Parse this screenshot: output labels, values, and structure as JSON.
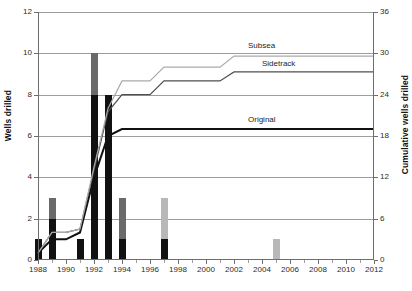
{
  "chart_data": {
    "type": "bar",
    "title": "",
    "xlabel": "",
    "ylabel": "Wells drilled",
    "y2label": "Cumulative wells drilled",
    "xlim": [
      1988,
      2012
    ],
    "ylim": [
      0,
      12
    ],
    "y2lim": [
      0,
      36
    ],
    "grid": true,
    "legend_position": "inline-right-of-lines",
    "x_ticks": [
      1988,
      1990,
      1992,
      1994,
      1996,
      1998,
      2000,
      2002,
      2004,
      2006,
      2008,
      2010,
      2012
    ],
    "y_ticks": [
      0,
      2,
      4,
      6,
      8,
      10,
      12
    ],
    "y2_ticks": [
      0,
      6,
      12,
      18,
      24,
      30,
      36
    ],
    "categories": [
      1988,
      1989,
      1990,
      1991,
      1992,
      1993,
      1994,
      1995,
      1996,
      1997,
      1998,
      1999,
      2000,
      2001,
      2002,
      2003,
      2004,
      2005,
      2006,
      2007,
      2008,
      2009,
      2010,
      2011,
      2012
    ],
    "series": [
      {
        "name": "Original",
        "kind": "bar-segment",
        "color": "#111111",
        "values": [
          1,
          2,
          0,
          1,
          8,
          8,
          1,
          0,
          0,
          1,
          0,
          0,
          0,
          0,
          0,
          0,
          0,
          0,
          0,
          0,
          0,
          0,
          0,
          0,
          0
        ]
      },
      {
        "name": "Sidetrack",
        "kind": "bar-segment",
        "color": "#6a6a6a",
        "values": [
          0,
          1,
          0,
          0,
          2,
          0,
          2,
          0,
          0,
          0,
          0,
          0,
          0,
          0,
          0,
          0,
          0,
          0,
          0,
          0,
          0,
          0,
          0,
          0,
          0
        ]
      },
      {
        "name": "Subsea",
        "kind": "bar-segment",
        "color": "#b8b8b8",
        "values": [
          0,
          0,
          0,
          0,
          0,
          0,
          0,
          0,
          0,
          2,
          0,
          0,
          0,
          0,
          0,
          0,
          0,
          1,
          0,
          0,
          0,
          0,
          0,
          0,
          0
        ]
      },
      {
        "name": "Original",
        "kind": "cumulative-line",
        "color": "#111111",
        "axis": "right",
        "values": [
          1,
          3,
          3,
          4,
          12,
          18,
          19,
          19,
          19,
          19,
          19,
          19,
          19,
          19,
          19,
          19,
          19,
          19,
          19,
          19,
          19,
          19,
          19,
          19,
          19
        ]
      },
      {
        "name": "Sidetrack",
        "kind": "cumulative-line",
        "color": "#4f4f4f",
        "axis": "right",
        "values": [
          1,
          4,
          4,
          4.5,
          13,
          21.5,
          24,
          24,
          24,
          26,
          26,
          26,
          26,
          26,
          27.3,
          27.3,
          27.3,
          27.3,
          27.3,
          27.3,
          27.3,
          27.3,
          27.3,
          27.3,
          27.3
        ]
      },
      {
        "name": "Subsea",
        "kind": "cumulative-line",
        "color": "#aaaaaa",
        "axis": "right",
        "values": [
          1,
          4,
          4,
          4.5,
          13.5,
          22,
          26,
          26,
          26,
          28,
          28,
          28,
          28,
          28,
          29.6,
          29.6,
          29.6,
          29.6,
          29.6,
          29.6,
          29.6,
          29.6,
          29.6,
          29.6,
          29.6
        ]
      }
    ],
    "annotations": [
      {
        "text": "Subsea",
        "x": 2003,
        "y2": 31.0
      },
      {
        "text": "Sidetrack",
        "x": 2004,
        "y2": 28.4
      },
      {
        "text": "Original",
        "x": 2003,
        "y2": 20.3
      }
    ]
  }
}
